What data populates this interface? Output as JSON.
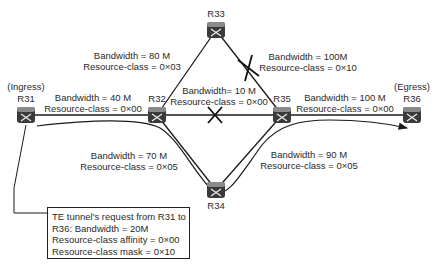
{
  "routers": [
    {
      "id": "R31",
      "label": "R31",
      "role": "(Ingress)",
      "x": 26,
      "y": 115
    },
    {
      "id": "R32",
      "label": "R32",
      "x": 157,
      "y": 115
    },
    {
      "id": "R33",
      "label": "R33",
      "x": 216,
      "y": 30
    },
    {
      "id": "R34",
      "label": "R34",
      "x": 216,
      "y": 190
    },
    {
      "id": "R35",
      "label": "R35",
      "x": 282,
      "y": 115
    },
    {
      "id": "R36",
      "label": "R36",
      "role": "(Egress)",
      "x": 412,
      "y": 115
    }
  ],
  "links": [
    {
      "from": "R31",
      "to": "R32",
      "bandwidth": "Bandwidth = 40 M",
      "resource_class": "Resource-class = 0×00",
      "excluded": false
    },
    {
      "from": "R32",
      "to": "R33",
      "bandwidth": "Bandwidth = 80 M",
      "resource_class": "Resource-class = 0×03",
      "excluded": false
    },
    {
      "from": "R33",
      "to": "R35",
      "bandwidth": "Bandwidth = 100M",
      "resource_class": "Resource-class = 0×10",
      "excluded": true
    },
    {
      "from": "R32",
      "to": "R35",
      "bandwidth": "Bandwidth= 10 M",
      "resource_class": "Resource-class = 0×00",
      "excluded": true
    },
    {
      "from": "R35",
      "to": "R36",
      "bandwidth": "Bandwidth = 100 M",
      "resource_class": "Resource-class = 0×00",
      "excluded": false
    },
    {
      "from": "R32",
      "to": "R34",
      "bandwidth": "Bandwidth = 70 M",
      "resource_class": "Resource-class = 0×05",
      "excluded": false
    },
    {
      "from": "R34",
      "to": "R35",
      "bandwidth": "Bandwidth = 90 M",
      "resource_class": "Resource-class = 0×05",
      "excluded": false
    }
  ],
  "tunnel_path": [
    "R31",
    "R32",
    "R34",
    "R35",
    "R36"
  ],
  "request": {
    "line1": "TE tunnel's request from R31 to",
    "line2": "R36: Bandwidth = 20M",
    "line3": "Resource-class affinity = 0×00",
    "line4": "Resource-class mask = 0×10"
  },
  "colors": {
    "line": "#1a1a1a",
    "router_fill": "#3a3a3a",
    "router_top": "#8a8a8a"
  }
}
